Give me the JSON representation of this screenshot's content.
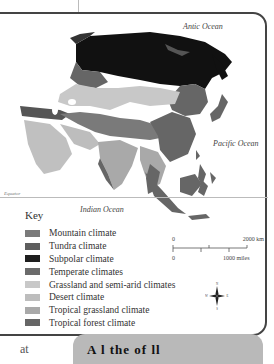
{
  "map": {
    "oceans": {
      "arctic": "Antic Ocean",
      "pacific": "Pacific Ocean",
      "indian": "Indian Ocean"
    },
    "equator_label": "Equator"
  },
  "key": {
    "title": "Key",
    "items": [
      {
        "label": "Mountain climate",
        "color": "#7a7a7a"
      },
      {
        "label": "Tundra climate",
        "color": "#5e5e5e"
      },
      {
        "label": "Subpolar climate",
        "color": "#1e1e1e"
      },
      {
        "label": "Temperate climates",
        "color": "#6b6b6b"
      },
      {
        "label": "Grassland and semi-arid climates",
        "color": "#c8c8c8"
      },
      {
        "label": "Desert climate",
        "color": "#bdbdbd"
      },
      {
        "label": "Tropical grassland climate",
        "color": "#a9a9a9"
      },
      {
        "label": "Tropical forest climate",
        "color": "#666666"
      }
    ]
  },
  "scale": {
    "km_start": "0",
    "km_end": "2000 km",
    "mi_start": "0",
    "mi_end": "1000 miles"
  },
  "compass": {
    "n": "N",
    "s": "S",
    "e": "E",
    "w": "W"
  },
  "bottom": {
    "left_text": "at",
    "box_text": "A   l   the   of   ll"
  }
}
